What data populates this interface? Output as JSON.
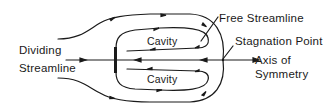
{
  "diagram": {
    "type": "flow-schematic",
    "labels": {
      "dividing_streamline_line1": "Dividing",
      "dividing_streamline_line2": "Streamline",
      "free_streamline": "Free Streamline",
      "stagnation_point": "Stagnation Point",
      "axis_line1": "Axis of",
      "axis_line2": "Symmetry",
      "cavity_upper": "Cavity",
      "cavity_lower": "Cavity"
    },
    "colors": {
      "stroke": "#1a1a1a",
      "background": "#ffffff"
    },
    "elements": [
      "outer-streamline-upper",
      "outer-streamline-lower",
      "free-streamline-upper",
      "free-streamline-lower",
      "cavity-loop-upper",
      "cavity-loop-lower",
      "axis-of-symmetry",
      "plate",
      "stagnation-point"
    ]
  }
}
